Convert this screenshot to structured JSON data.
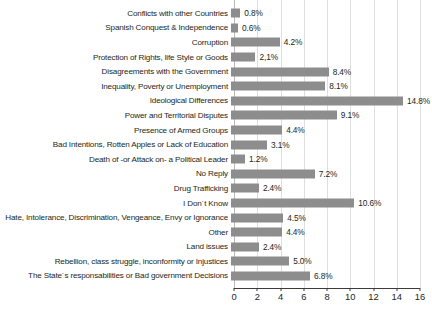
{
  "chart_data": {
    "type": "bar",
    "orientation": "horizontal",
    "title": "",
    "subtitle": "",
    "xlabel": "",
    "ylabel": "",
    "xlim": [
      0,
      16
    ],
    "xticks": [
      0,
      2,
      4,
      6,
      8,
      10,
      12,
      14,
      16
    ],
    "xtick_labels": [
      "0",
      "2",
      "4",
      "6",
      "8",
      "10",
      "12",
      "14",
      "16"
    ],
    "grid": true,
    "grid_axis": "x",
    "legend": false,
    "legend_position": "none",
    "bar_color": "#8d8d8d",
    "gridline_color": "#dededd",
    "axis_color": "#3d3a39",
    "text_color": "#231f20",
    "value_suffix": "%",
    "categories": [
      "Conflicts with other Countries",
      "Spanish Conquest & Independence",
      "Corruption",
      "Protection of Rights, life Style or Goods",
      "Disagreements with the Government",
      "Inequality, Poverty or Unemployment",
      "Ideological Differences",
      "Power and Territorial Disputes",
      "Presence of Armed Groups",
      "Bad Intentions, Rotten Apples or Lack of Education",
      "Death of -or Attack on- a Political Leader",
      "No Reply",
      "Drug Trafficking",
      "I Don´t Know",
      "Hate, Intolerance, Discrimination, Vengeance, Envy or Ignorance",
      "Other",
      "Land issues",
      "Rebellion, class struggle, inconformity or Injustices",
      "The State´s responsabilities or Bad government Decisions"
    ],
    "values": [
      0.8,
      0.6,
      4.2,
      2.1,
      8.4,
      8.1,
      14.8,
      9.1,
      4.4,
      3.1,
      1.2,
      7.2,
      2.4,
      10.6,
      4.5,
      4.4,
      2.4,
      5.0,
      6.8
    ],
    "data_labels": [
      "0.8%",
      "0.6%",
      "4.2%",
      "2,1%",
      "8.4%",
      "8.1%",
      "14.8%",
      "9.1%",
      "4.4%",
      "3.1%",
      "1.2%",
      "7.2%",
      "2.4%",
      "10.6%",
      "4.5%",
      "4.4%",
      "2.4%",
      "5.0%",
      "6.8%"
    ]
  }
}
